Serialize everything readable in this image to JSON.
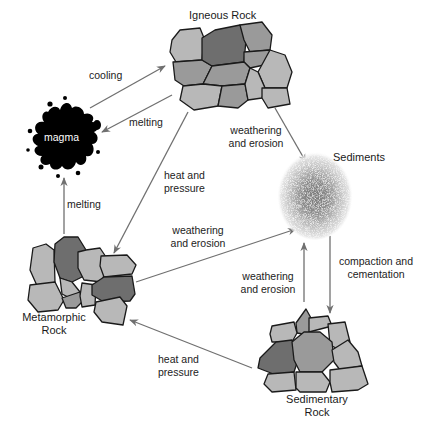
{
  "nodes": {
    "igneous": {
      "label": "Igneous Rock"
    },
    "magma": {
      "label": "magma"
    },
    "sediments": {
      "label": "Sediments"
    },
    "metamorphic": {
      "label_line1": "Metamorphic",
      "label_line2": "Rock"
    },
    "sedimentary": {
      "label_line1": "Sedimentary",
      "label_line2": "Rock"
    }
  },
  "edges": [
    {
      "from": "magma",
      "to": "igneous",
      "label_line1": "cooling",
      "label_line2": ""
    },
    {
      "from": "igneous",
      "to": "magma",
      "label_line1": "melting",
      "label_line2": ""
    },
    {
      "from": "metamorphic",
      "to": "magma",
      "label_line1": "melting",
      "label_line2": ""
    },
    {
      "from": "igneous",
      "to": "sediments",
      "label_line1": "weathering",
      "label_line2": "and erosion"
    },
    {
      "from": "igneous",
      "to": "metamorphic",
      "label_line1": "heat and",
      "label_line2": "pressure"
    },
    {
      "from": "metamorphic",
      "to": "sediments",
      "label_line1": "weathering",
      "label_line2": "and erosion"
    },
    {
      "from": "sedimentary",
      "to": "sediments",
      "label_line1": "weathering",
      "label_line2": "and erosion"
    },
    {
      "from": "sediments",
      "to": "sedimentary",
      "label_line1": "compaction and",
      "label_line2": "cementation"
    },
    {
      "from": "sedimentary",
      "to": "metamorphic",
      "label_line1": "heat and",
      "label_line2": "pressure"
    }
  ],
  "colors": {
    "rock_light": "#b8b8b8",
    "rock_mid": "#9a9a9a",
    "rock_dark": "#6e6e6e",
    "arrow": "#707070",
    "magma": "#000000"
  }
}
